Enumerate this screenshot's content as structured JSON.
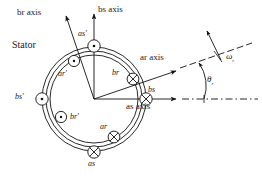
{
  "diagram": {
    "title_hidden": "Two-pole, two-phase symmetrical induction machine cross-section",
    "type": "machine-cross-section",
    "center": {
      "x": 94,
      "y": 99
    },
    "stator_outer_radius": 52,
    "rotor_radius": 44,
    "ar_axis_angle_deg": 27,
    "labels": {
      "stator": "Stator",
      "br_axis": "br axis",
      "bs_axis": "bs axis",
      "ar_axis": "ar axis",
      "as_axis": "as axis",
      "theta_r": "θ",
      "theta_r_sub": "r",
      "omega_r": "ω",
      "omega_r_sub": "r"
    },
    "windings": [
      {
        "name": "as-prime",
        "label": "as'",
        "marker": "dot",
        "x": 94,
        "y": 46,
        "belongs": "stator"
      },
      {
        "name": "as",
        "label": "as",
        "marker": "cross",
        "x": 94,
        "y": 152,
        "belongs": "stator"
      },
      {
        "name": "bs-prime",
        "label": "bs'",
        "marker": "dot",
        "x": 42,
        "y": 99,
        "belongs": "stator"
      },
      {
        "name": "bs",
        "label": "bs",
        "marker": "cross",
        "x": 146,
        "y": 99,
        "belongs": "stator"
      },
      {
        "name": "ar-prime",
        "label": "ar'",
        "marker": "dot",
        "x": 74,
        "y": 61,
        "belongs": "rotor"
      },
      {
        "name": "ar",
        "label": "ar",
        "marker": "cross",
        "x": 114,
        "y": 137,
        "belongs": "rotor"
      },
      {
        "name": "br-prime",
        "label": "br'",
        "marker": "dot",
        "x": 61,
        "y": 117,
        "belongs": "rotor"
      },
      {
        "name": "br",
        "label": "br",
        "marker": "cross",
        "x": 133,
        "y": 79,
        "belongs": "rotor"
      }
    ]
  }
}
